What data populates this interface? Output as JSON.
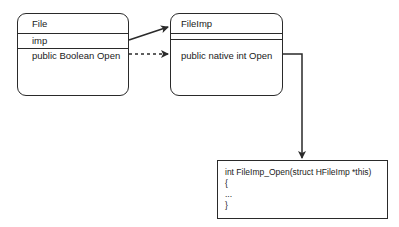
{
  "diagram": {
    "classes": [
      {
        "id": "file",
        "name": "File",
        "fields": [
          "imp"
        ],
        "methods": [
          "public Boolean Open"
        ]
      },
      {
        "id": "fileimp",
        "name": "FileImp",
        "fields": [],
        "methods": [
          "public native int Open"
        ]
      }
    ],
    "code_box": {
      "lines": [
        "int FileImp_Open(struct HFileImp *this)",
        "{",
        "...",
        "}"
      ]
    },
    "connections": [
      {
        "from": "File.imp",
        "to": "FileImp",
        "style": "solid",
        "arrow": "open-filled"
      },
      {
        "from": "File.Open",
        "to": "FileImp.Open",
        "style": "dashed",
        "arrow": "filled"
      },
      {
        "from": "FileImp.Open",
        "to": "code_box",
        "style": "solid",
        "arrow": "filled",
        "routing": "orthogonal"
      }
    ],
    "colors": {
      "stroke": "#2a2a2a",
      "background": "#ffffff",
      "text": "#1a1a1a"
    }
  }
}
